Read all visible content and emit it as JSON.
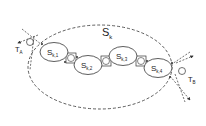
{
  "diagram": {
    "outer_label": {
      "main": "S",
      "sub": "k"
    },
    "nodes": [
      {
        "id": "sk1",
        "main": "S",
        "sub": "k,1"
      },
      {
        "id": "sk2",
        "main": "S",
        "sub": "k,2"
      },
      {
        "id": "sk3",
        "main": "S",
        "sub": "k,3"
      },
      {
        "id": "sk4",
        "main": "S",
        "sub": "k,4"
      }
    ],
    "terminals": [
      {
        "id": "ta",
        "main": "T",
        "sub": "A"
      },
      {
        "id": "tb",
        "main": "T",
        "sub": "B"
      }
    ],
    "stroke_color": "#333333",
    "background_color": "#ffffff"
  }
}
